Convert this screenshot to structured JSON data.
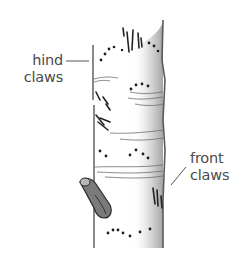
{
  "labels": {
    "hind": {
      "line1": "hind",
      "line2": "claws"
    },
    "front": {
      "line1": "front",
      "line2": "claws"
    }
  },
  "colors": {
    "ink": "#2a2a2a",
    "label_text": "#4a4a4a",
    "leader_line": "#555555",
    "shading": "#8a8a8a"
  }
}
